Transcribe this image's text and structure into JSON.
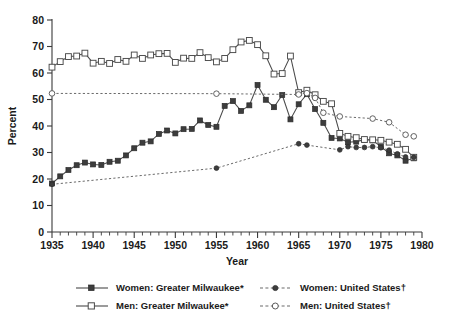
{
  "chart_data": {
    "type": "line",
    "title": "",
    "xlabel": "Year",
    "ylabel": "Percent",
    "xlim": [
      1935,
      1980
    ],
    "ylim": [
      0,
      80
    ],
    "ytick_labels": [
      "0",
      "10",
      "20",
      "30",
      "40",
      "50",
      "60",
      "70",
      "80"
    ],
    "yticks": [
      0,
      10,
      20,
      30,
      40,
      50,
      60,
      70,
      80
    ],
    "xtick_labels": [
      "1935",
      "1940",
      "1945",
      "1950",
      "1955",
      "1960",
      "1965",
      "1970",
      "1975",
      "1980"
    ],
    "xticks": [
      1935,
      1940,
      1945,
      1950,
      1955,
      1960,
      1965,
      1970,
      1975,
      1980
    ],
    "x_minor_tick_interval": 1,
    "grid": false,
    "legend_position": "below",
    "series": [
      {
        "name": "Women: Greater Milwaukee*",
        "style": "solid",
        "marker": "filled-square",
        "x": [
          1935,
          1936,
          1937,
          1938,
          1939,
          1940,
          1941,
          1942,
          1943,
          1944,
          1945,
          1946,
          1947,
          1948,
          1949,
          1950,
          1951,
          1952,
          1953,
          1954,
          1955,
          1956,
          1957,
          1958,
          1959,
          1960,
          1961,
          1962,
          1963,
          1964,
          1965,
          1966,
          1967,
          1968,
          1969,
          1970,
          1971,
          1972,
          1973,
          1974,
          1975,
          1976,
          1977,
          1978,
          1979
        ],
        "values": [
          18.3,
          21.0,
          23.4,
          25.2,
          26.2,
          25.5,
          25.3,
          26.5,
          26.9,
          28.9,
          31.6,
          33.7,
          34.2,
          37.0,
          38.3,
          37.2,
          38.8,
          38.9,
          42.1,
          40.4,
          39.7,
          47.6,
          49.4,
          45.7,
          47.8,
          55.5,
          49.9,
          47.1,
          51.7,
          42.5,
          48.2,
          52.0,
          46.4,
          41.2,
          35.5,
          35.3,
          33.9,
          34.1,
          34.8,
          34.6,
          32.2,
          29.7,
          28.9,
          26.9,
          27.8
        ]
      },
      {
        "name": "Men: Greater Milwaukee*",
        "style": "solid",
        "marker": "open-square",
        "x": [
          1935,
          1936,
          1937,
          1938,
          1939,
          1940,
          1941,
          1942,
          1943,
          1944,
          1945,
          1946,
          1947,
          1948,
          1949,
          1950,
          1951,
          1952,
          1953,
          1954,
          1955,
          1956,
          1957,
          1958,
          1959,
          1960,
          1961,
          1962,
          1963,
          1964,
          1965,
          1966,
          1967,
          1968,
          1969,
          1970,
          1971,
          1972,
          1973,
          1974,
          1975,
          1976,
          1977,
          1978,
          1979
        ],
        "values": [
          62.2,
          64.3,
          66.2,
          66.4,
          67.5,
          63.7,
          64.4,
          63.6,
          65.1,
          64.4,
          66.8,
          65.5,
          66.8,
          67.3,
          67.4,
          64.0,
          65.6,
          65.5,
          67.7,
          65.8,
          64.2,
          65.5,
          68.8,
          71.7,
          72.3,
          70.7,
          66.5,
          59.6,
          59.8,
          66.4,
          52.6,
          53.5,
          51.8,
          49.3,
          48.4,
          37.2,
          36.1,
          35.6,
          34.9,
          34.8,
          34.6,
          33.9,
          33.1,
          31.2,
          28.2
        ]
      },
      {
        "name": "Women: United States†",
        "style": "dashed",
        "marker": "filled-circle",
        "x": [
          1935,
          1955,
          1965,
          1966,
          1970,
          1971,
          1972,
          1973,
          1974,
          1975,
          1976,
          1977,
          1978,
          1979
        ],
        "values": [
          18.0,
          24.1,
          33.3,
          32.8,
          31.0,
          32.2,
          31.9,
          31.9,
          32.2,
          31.8,
          30.9,
          29.5,
          28.3,
          28.2
        ]
      },
      {
        "name": "Men: United States†",
        "style": "dashed",
        "marker": "open-circle",
        "x": [
          1935,
          1955,
          1965,
          1966,
          1967,
          1968,
          1970,
          1974,
          1976,
          1978,
          1979
        ],
        "values": [
          52.3,
          52.2,
          51.9,
          52.4,
          50.6,
          45.0,
          43.6,
          42.8,
          41.4,
          36.7,
          36.1
        ]
      }
    ]
  },
  "legend": {
    "entries": [
      {
        "label": "Women: Greater Milwaukee*",
        "style": "solid",
        "marker": "filled-square"
      },
      {
        "label": "Women: United States†",
        "style": "dashed",
        "marker": "filled-circle"
      },
      {
        "label": "Men: Greater Milwaukee*",
        "style": "solid",
        "marker": "open-square"
      },
      {
        "label": "Men: United States†",
        "style": "dashed",
        "marker": "open-circle"
      }
    ]
  },
  "colors": {
    "axis": "#3a3a3a",
    "solid_series": "#4a4a4a",
    "dashed_series": "#6a6a6a",
    "marker_fill": "#3d3d3d",
    "background": "#ffffff"
  }
}
